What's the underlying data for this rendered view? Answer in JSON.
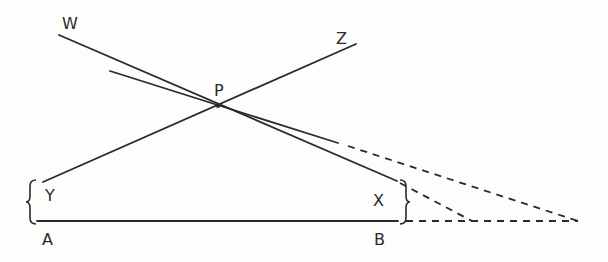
{
  "diagram": {
    "labels": {
      "W": "W",
      "Z": "Z",
      "P": "P",
      "Y": "Y",
      "X": "X",
      "A": "A",
      "B": "B"
    },
    "stroke_color": "#2a2a2a",
    "background_color": "#fdfdfc",
    "elements": [
      {
        "name": "line-WX",
        "type": "solid",
        "from": "W",
        "through": "P",
        "to": "X"
      },
      {
        "name": "line-tangent-through-P",
        "type": "solid",
        "through": "P"
      },
      {
        "name": "line-YZ",
        "type": "solid",
        "from": "Y",
        "through": "P",
        "to": "Z"
      },
      {
        "name": "baseline-AB",
        "type": "solid",
        "from": "A",
        "to": "B"
      },
      {
        "name": "extension-WX",
        "type": "dashed",
        "meets": "baseline-extension"
      },
      {
        "name": "extension-tangent",
        "type": "dashed",
        "meets": "baseline-extension"
      },
      {
        "name": "extension-AB",
        "type": "dashed"
      },
      {
        "name": "brace-YA",
        "type": "brace",
        "groups": [
          "Y",
          "A"
        ]
      },
      {
        "name": "brace-XB",
        "type": "brace",
        "groups": [
          "X",
          "B"
        ]
      }
    ]
  }
}
